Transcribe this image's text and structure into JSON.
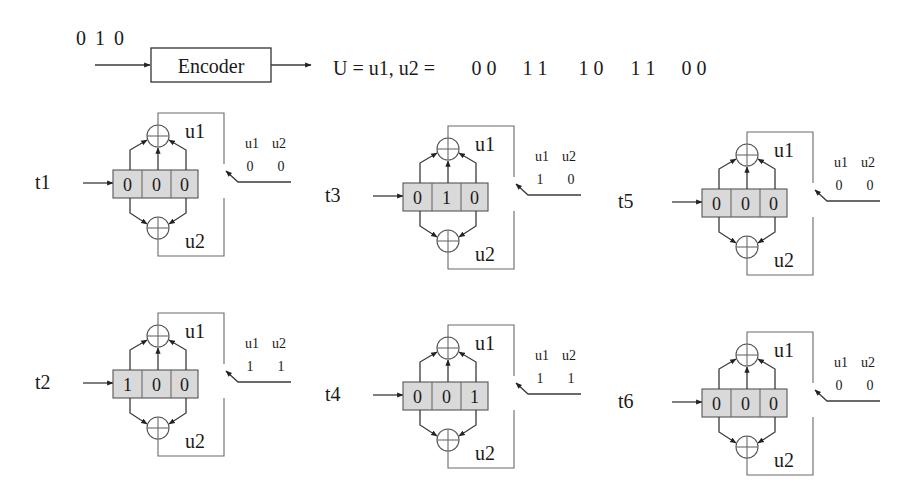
{
  "header": {
    "input_bits": "0 1 0",
    "encoder_label": "Encoder",
    "output_prefix": "U = u1, u2 =",
    "output_pairs": [
      "0 0",
      "1 1",
      "1 0",
      "1 1",
      "0 0"
    ]
  },
  "colors": {
    "register_fill": "#d9d9d9",
    "line": "#3a3a3a"
  },
  "blocks": [
    {
      "label": "t1",
      "register": [
        "0",
        "0",
        "0"
      ],
      "out_header_u1": "u1",
      "out_header_u2": "u2",
      "out_u1": "0",
      "out_u2": "0",
      "adder_top_label": "u1",
      "adder_bottom_label": "u2"
    },
    {
      "label": "t2",
      "register": [
        "1",
        "0",
        "0"
      ],
      "out_header_u1": "u1",
      "out_header_u2": "u2",
      "out_u1": "1",
      "out_u2": "1",
      "adder_top_label": "u1",
      "adder_bottom_label": "u2"
    },
    {
      "label": "t3",
      "register": [
        "0",
        "1",
        "0"
      ],
      "out_header_u1": "u1",
      "out_header_u2": "u2",
      "out_u1": "1",
      "out_u2": "0",
      "adder_top_label": "u1",
      "adder_bottom_label": "u2"
    },
    {
      "label": "t4",
      "register": [
        "0",
        "0",
        "1"
      ],
      "out_header_u1": "u1",
      "out_header_u2": "u2",
      "out_u1": "1",
      "out_u2": "1",
      "adder_top_label": "u1",
      "adder_bottom_label": "u2"
    },
    {
      "label": "t5",
      "register": [
        "0",
        "0",
        "0"
      ],
      "out_header_u1": "u1",
      "out_header_u2": "u2",
      "out_u1": "0",
      "out_u2": "0",
      "adder_top_label": "u1",
      "adder_bottom_label": "u2"
    },
    {
      "label": "t6",
      "register": [
        "0",
        "0",
        "0"
      ],
      "out_header_u1": "u1",
      "out_header_u2": "u2",
      "out_u1": "0",
      "out_u2": "0",
      "adder_top_label": "u1",
      "adder_bottom_label": "u2"
    }
  ]
}
